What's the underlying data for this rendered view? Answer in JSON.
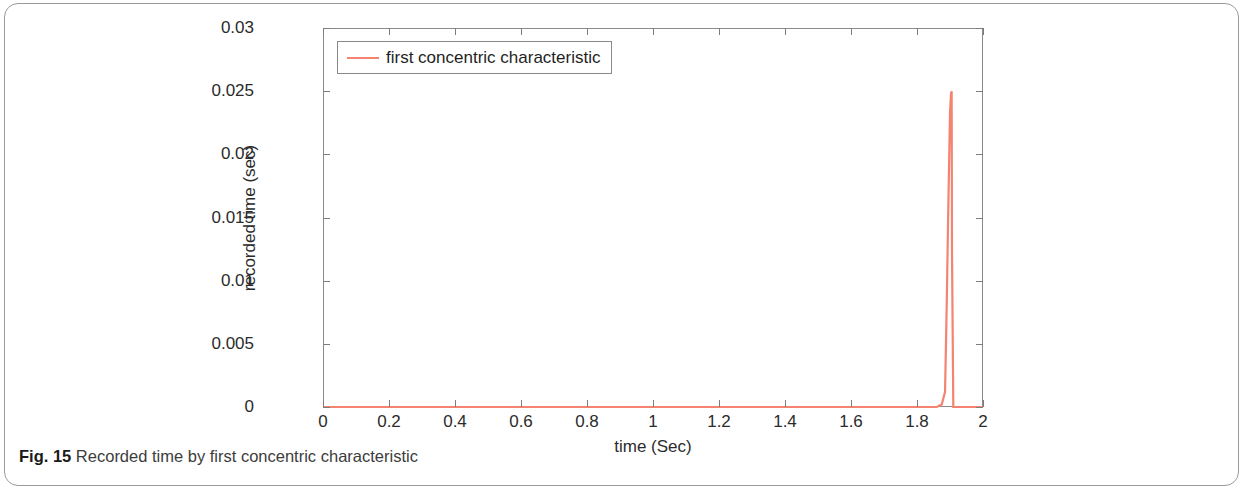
{
  "caption": {
    "figure_number": "Fig. 15",
    "text": "Recorded time by first concentric characteristic"
  },
  "colors": {
    "series_line": "#f4836f",
    "axis": "#8a8a8a",
    "text": "#2b2b2b",
    "background": "#ffffff"
  },
  "chart_data": {
    "type": "line",
    "title": "",
    "xlabel": "time (Sec)",
    "ylabel": "recorded time (sec)",
    "xlim": [
      0,
      2
    ],
    "ylim": [
      0,
      0.03
    ],
    "xticks": [
      0,
      0.2,
      0.4,
      0.6,
      0.8,
      1,
      1.2,
      1.4,
      1.6,
      1.8,
      2
    ],
    "xticklabels": [
      "0",
      "0.2",
      "0.4",
      "0.6",
      "0.8",
      "1",
      "1.2",
      "1.4",
      "1.6",
      "1.8",
      "2"
    ],
    "yticks": [
      0,
      0.005,
      0.01,
      0.015,
      0.02,
      0.025,
      0.03
    ],
    "yticklabels": [
      "0",
      "0.005",
      "0.01",
      "0.015",
      "0.02",
      "0.025",
      "0.03"
    ],
    "grid": false,
    "legend_position": "top-left",
    "series": [
      {
        "name": "first concentric characteristic",
        "color": "#f4836f",
        "x": [
          0,
          0.2,
          0.4,
          0.6,
          0.8,
          1.0,
          1.2,
          1.4,
          1.6,
          1.8,
          1.86,
          1.875,
          1.885,
          1.89,
          1.895,
          1.9,
          1.903,
          1.905,
          1.906,
          1.91,
          1.95,
          2.0
        ],
        "y": [
          0,
          0,
          0,
          0,
          0,
          0,
          0,
          0,
          0,
          0,
          0,
          0.0002,
          0.0012,
          0.008,
          0.016,
          0.0232,
          0.0248,
          0.025,
          0.0125,
          0,
          0,
          0
        ]
      }
    ]
  }
}
